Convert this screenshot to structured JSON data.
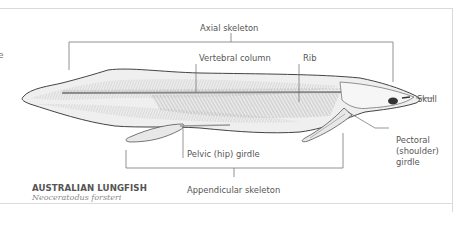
{
  "diagram": {
    "title": "AUSTRALIAN LUNGFISH",
    "subtitle": "Neoceratodus forsteri",
    "clipped_left_text": "e",
    "labels": {
      "axial_skeleton": "Axial skeleton",
      "vertebral_column": "Vertebral column",
      "rib": "Rib",
      "skull": "Skull",
      "pectoral_line1": "Pectoral",
      "pectoral_line2": "(shoulder)",
      "pectoral_line3": "girdle",
      "pelvic_girdle": "Pelvic (hip) girdle",
      "appendicular_skeleton": "Appendicular skeleton"
    },
    "colors": {
      "outline": "#4a4a4a",
      "body_fill": "#eeeeee",
      "bone": "#9a9a9a",
      "leader": "#6a6a6a",
      "frame": "#d9d9d9",
      "eye": "#333333"
    }
  }
}
